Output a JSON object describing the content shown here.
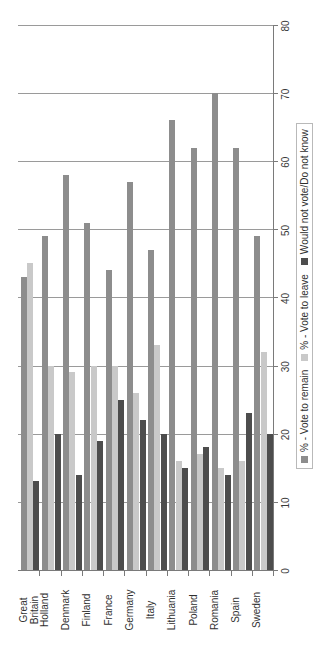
{
  "chart_data": {
    "type": "bar",
    "orientation": "horizontal",
    "title": "",
    "xlabel": "",
    "ylabel": "",
    "grid": true,
    "legend_position": "bottom",
    "xlim": [
      0,
      80
    ],
    "xticks": [
      0,
      10,
      20,
      30,
      40,
      50,
      60,
      70,
      80
    ],
    "categories": [
      "Great\nBritain",
      "Holland",
      "Denmark",
      "Finland",
      "France",
      "Germany",
      "Italy",
      "Lithuania",
      "Poland",
      "Romania",
      "Spain",
      "Sweden"
    ],
    "series": [
      {
        "name": "% - Vote to remain",
        "color": "#8d8d8d",
        "values": [
          43,
          49,
          58,
          51,
          44,
          57,
          47,
          66,
          62,
          70,
          62,
          49
        ]
      },
      {
        "name": "% - Vote to leave",
        "color": "#c9c9c9",
        "values": [
          45,
          30,
          29,
          30,
          30,
          26,
          33,
          16,
          17,
          15,
          16,
          32
        ]
      },
      {
        "name": "Would not vote/Do not know",
        "color": "#4d4d4d",
        "values": [
          13,
          20,
          14,
          19,
          25,
          22,
          20,
          15,
          18,
          14,
          23,
          20
        ]
      }
    ]
  },
  "legend": {
    "items": [
      "% - Vote to remain",
      "% - Vote to leave",
      "Would not vote/Do not know"
    ]
  },
  "axis": {
    "tick_labels": [
      "80",
      "70",
      "60",
      "50",
      "40",
      "30",
      "20",
      "10",
      "0"
    ]
  }
}
